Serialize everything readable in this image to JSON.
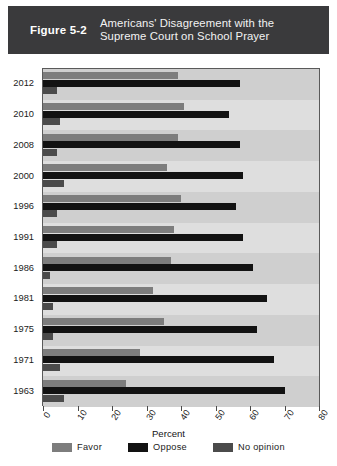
{
  "figure": {
    "label": "Figure 5-2",
    "title_line1": "Americans' Disagreement with the",
    "title_line2": "Supreme Court on School Prayer",
    "banner_color": "#3a3a3c"
  },
  "legend": {
    "items": [
      {
        "key": "favor",
        "label": "Favor",
        "color": "#7d7d7d"
      },
      {
        "key": "oppose",
        "label": "Oppose",
        "color": "#121212"
      },
      {
        "key": "noop",
        "label": "No opinion",
        "color": "#4b4b4b"
      }
    ]
  },
  "chart_data": {
    "type": "bar",
    "orientation": "horizontal",
    "title": "Americans' Disagreement with the Supreme Court on School Prayer",
    "xlabel": "Percent",
    "ylabel": "",
    "xlim": [
      0,
      80
    ],
    "xticks": [
      0,
      10,
      20,
      30,
      40,
      50,
      60,
      70,
      80
    ],
    "xtick_labels": [
      "0",
      "10",
      "20",
      "30",
      "40",
      "50",
      "60",
      "70",
      "80"
    ],
    "grid": false,
    "legend_position": "bottom",
    "categories": [
      "2012",
      "2010",
      "2008",
      "2000",
      "1996",
      "1991",
      "1986",
      "1981",
      "1975",
      "1971",
      "1963"
    ],
    "series": [
      {
        "name": "Favor",
        "color": "#7d7d7d",
        "values": [
          39,
          41,
          39,
          36,
          40,
          38,
          37,
          32,
          35,
          28,
          24
        ]
      },
      {
        "name": "Oppose",
        "color": "#121212",
        "values": [
          57,
          54,
          57,
          58,
          56,
          58,
          61,
          65,
          62,
          67,
          70
        ]
      },
      {
        "name": "No opinion",
        "color": "#4b4b4b",
        "values": [
          4,
          5,
          4,
          6,
          4,
          4,
          2,
          3,
          3,
          5,
          6
        ]
      }
    ]
  }
}
